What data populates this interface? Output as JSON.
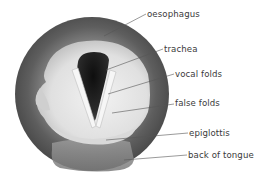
{
  "diagram": {
    "labels": [
      {
        "id": "oesophagus",
        "text": "oesophagus",
        "x": 147,
        "y": 10
      },
      {
        "id": "trachea",
        "text": "trachea",
        "x": 164,
        "y": 45
      },
      {
        "id": "vocal-folds",
        "text": "vocal folds",
        "x": 175,
        "y": 70
      },
      {
        "id": "false-folds",
        "text": "false folds",
        "x": 175,
        "y": 99
      },
      {
        "id": "epiglottis",
        "text": "epiglottis",
        "x": 189,
        "y": 129
      },
      {
        "id": "back-of-tongue",
        "text": "back of tongue",
        "x": 188,
        "y": 151
      }
    ],
    "colors": {
      "outer_ring": "#5a5a5a",
      "inner_tissue": "#e2e2e2",
      "trachea_opening": "#1e1e1e",
      "folds": "#f4f4f4",
      "leader_line": "#555555",
      "text": "#3a3a3a"
    }
  }
}
